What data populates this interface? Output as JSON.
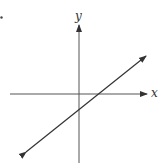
{
  "diagram": {
    "type": "coordinate-plane-line",
    "axes": {
      "x_label": "x",
      "y_label": "y",
      "color": "#555555"
    },
    "line": {
      "description": "straight line with positive slope, arrows on both ends",
      "slope_sign": "positive",
      "x_intercept_sign": "positive",
      "y_intercept_sign": "negative",
      "color": "#333333"
    },
    "marker": {
      "description": "small dot at top-left edge"
    }
  }
}
